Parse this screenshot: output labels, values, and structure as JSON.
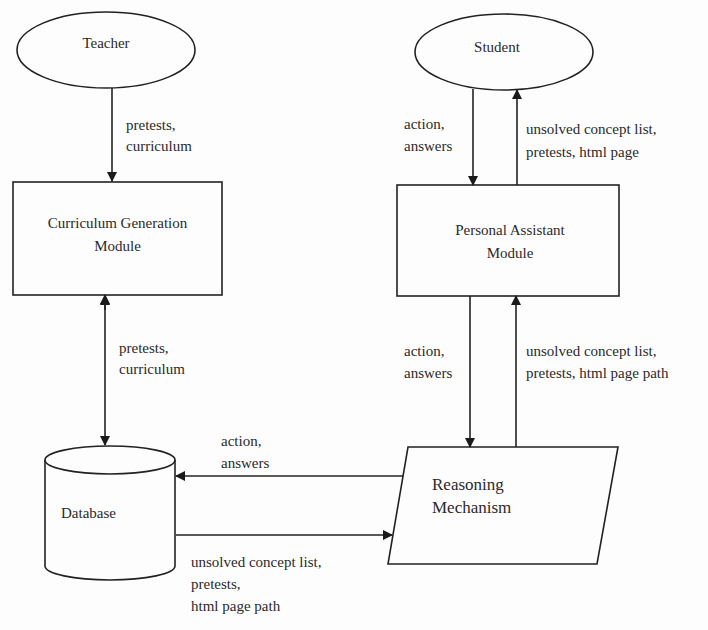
{
  "nodes": {
    "teacher": {
      "label": "Teacher",
      "shape": "ellipse"
    },
    "student": {
      "label": "Student",
      "shape": "ellipse"
    },
    "curriculum_module": {
      "line1": "Curriculum Generation",
      "line2": "Module",
      "shape": "rectangle"
    },
    "personal_assistant": {
      "line1": "Personal Assistant",
      "line2": "Module",
      "shape": "rectangle"
    },
    "database": {
      "label": "Database",
      "shape": "cylinder"
    },
    "reasoning": {
      "line1": "Reasoning",
      "line2": "Mechanism",
      "shape": "parallelogram"
    }
  },
  "edges": {
    "teacher_to_cgm": {
      "line1": "pretests,",
      "line2": "curriculum"
    },
    "cgm_db": {
      "line1": "pretests,",
      "line2": "curriculum"
    },
    "student_to_pam": {
      "line1": "action,",
      "line2": "answers"
    },
    "pam_to_student": {
      "line1": "unsolved concept list,",
      "line2": "pretests, html page"
    },
    "pam_to_rm": {
      "line1": "action,",
      "line2": "answers"
    },
    "rm_to_pam": {
      "line1": "unsolved concept list,",
      "line2": "pretests, html page path"
    },
    "rm_to_db": {
      "line1": "action,",
      "line2": "answers"
    },
    "db_to_rm": {
      "line1": "unsolved concept list,",
      "line2": "pretests,",
      "line3": "html page path"
    }
  }
}
